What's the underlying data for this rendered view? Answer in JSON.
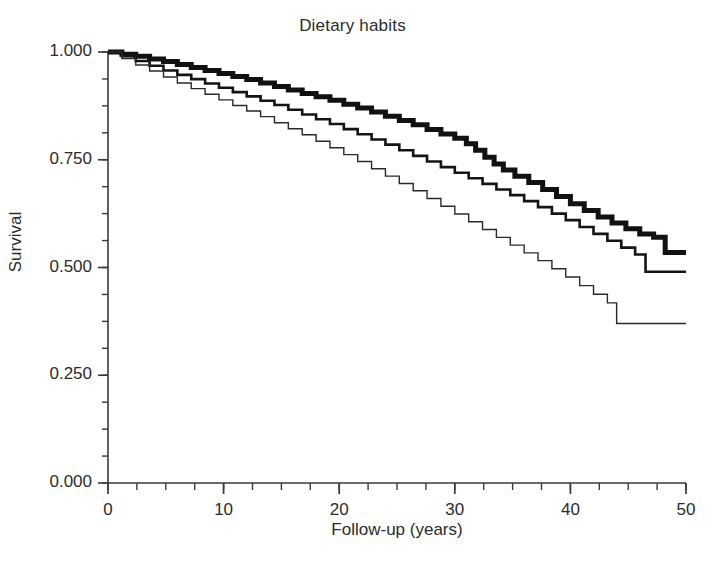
{
  "chart_data": {
    "type": "line",
    "title": "Dietary habits",
    "xlabel": "Follow-up (years)",
    "ylabel": "Survival",
    "xlim": [
      0,
      50
    ],
    "ylim": [
      0,
      1.0
    ],
    "grid": false,
    "legend_position": "none",
    "xticks": [
      0,
      10,
      20,
      30,
      40,
      50
    ],
    "xtick_labels": [
      "0",
      "10",
      "20",
      "30",
      "40",
      "50"
    ],
    "x_minor_tick_step": 2.5,
    "yticks": [
      0.0,
      0.25,
      0.5,
      0.75,
      1.0
    ],
    "ytick_labels": [
      "0.000",
      "0.250",
      "0.500",
      "0.750",
      "1.000"
    ],
    "y_minor_tick_step": 0.0625,
    "curve_style": "step",
    "series": [
      {
        "name": "thick-curve",
        "line_width": 5,
        "color": "#111111",
        "x": [
          0,
          1.2,
          2.4,
          3.6,
          4.8,
          6.0,
          7.2,
          8.4,
          9.6,
          10.8,
          12.0,
          13.2,
          14.4,
          15.6,
          16.8,
          18.0,
          19.2,
          20.4,
          21.6,
          22.8,
          24.0,
          25.2,
          26.4,
          27.6,
          28.8,
          30.0,
          31.0,
          31.8,
          32.6,
          33.4,
          34.2,
          35.2,
          36.4,
          37.6,
          38.8,
          40.0,
          41.2,
          42.4,
          43.6,
          44.8,
          46.0,
          47.2,
          48.2,
          50.0
        ],
        "y": [
          1.0,
          0.995,
          0.99,
          0.984,
          0.978,
          0.971,
          0.964,
          0.957,
          0.95,
          0.943,
          0.936,
          0.928,
          0.92,
          0.912,
          0.904,
          0.896,
          0.888,
          0.879,
          0.87,
          0.861,
          0.851,
          0.841,
          0.831,
          0.82,
          0.81,
          0.8,
          0.787,
          0.772,
          0.756,
          0.74,
          0.726,
          0.712,
          0.697,
          0.681,
          0.665,
          0.648,
          0.632,
          0.617,
          0.603,
          0.59,
          0.578,
          0.57,
          0.535,
          0.535
        ]
      },
      {
        "name": "medium-curve",
        "line_width": 2.6,
        "color": "#141414",
        "x": [
          0,
          1.2,
          2.4,
          3.6,
          4.8,
          6.0,
          7.2,
          8.4,
          9.6,
          10.8,
          12.0,
          13.2,
          14.4,
          15.6,
          16.8,
          18.0,
          19.2,
          20.4,
          21.6,
          22.8,
          24.0,
          25.2,
          26.4,
          27.6,
          28.8,
          30.0,
          31.2,
          32.4,
          33.6,
          34.8,
          36.0,
          37.2,
          38.4,
          39.6,
          40.8,
          42.0,
          43.2,
          44.4,
          45.6,
          46.5,
          50.0
        ],
        "y": [
          1.0,
          0.99,
          0.979,
          0.968,
          0.957,
          0.947,
          0.937,
          0.927,
          0.917,
          0.907,
          0.897,
          0.887,
          0.877,
          0.866,
          0.855,
          0.844,
          0.833,
          0.821,
          0.809,
          0.797,
          0.785,
          0.772,
          0.759,
          0.746,
          0.733,
          0.72,
          0.707,
          0.694,
          0.681,
          0.668,
          0.654,
          0.64,
          0.625,
          0.61,
          0.594,
          0.578,
          0.562,
          0.546,
          0.53,
          0.49,
          0.49
        ]
      },
      {
        "name": "thin-curve",
        "line_width": 1.4,
        "color": "#2a2a2a",
        "x": [
          0,
          1.2,
          2.4,
          3.6,
          4.8,
          6.0,
          7.2,
          8.4,
          9.6,
          10.8,
          12.0,
          13.2,
          14.4,
          15.6,
          16.8,
          18.0,
          19.2,
          20.4,
          21.6,
          22.8,
          24.0,
          25.2,
          26.4,
          27.6,
          28.8,
          30.0,
          31.2,
          32.4,
          33.6,
          34.8,
          36.0,
          37.2,
          38.4,
          39.6,
          40.8,
          42.0,
          43.2,
          44.0,
          50.0
        ],
        "y": [
          1.0,
          0.985,
          0.97,
          0.956,
          0.942,
          0.928,
          0.915,
          0.902,
          0.889,
          0.876,
          0.863,
          0.85,
          0.836,
          0.822,
          0.808,
          0.793,
          0.778,
          0.762,
          0.746,
          0.729,
          0.712,
          0.695,
          0.678,
          0.66,
          0.642,
          0.624,
          0.606,
          0.588,
          0.57,
          0.552,
          0.534,
          0.516,
          0.497,
          0.478,
          0.458,
          0.438,
          0.418,
          0.37,
          0.37
        ]
      }
    ]
  }
}
